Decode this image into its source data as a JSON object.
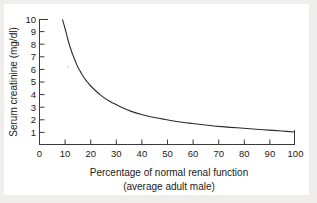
{
  "chart_data": {
    "type": "line",
    "title": "",
    "xlabel": "Percentage of normal renal function",
    "xlabel_line2": "(average adult male)",
    "ylabel": "Serum creatinine (mg/dl)",
    "xlim": [
      0,
      100
    ],
    "ylim": [
      0,
      10
    ],
    "grid": false,
    "legend": false,
    "xticks": [
      0,
      10,
      20,
      30,
      40,
      50,
      60,
      70,
      80,
      90,
      100
    ],
    "xtick_labels": [
      "0",
      "10",
      "20",
      "30",
      "40",
      "50",
      "60",
      "70",
      "80",
      "90",
      "100"
    ],
    "yticks": [
      1,
      2,
      3,
      4,
      5,
      6,
      7,
      8,
      9,
      10
    ],
    "ytick_labels": [
      "1",
      "2",
      "3",
      "4",
      "5",
      "6",
      "7",
      "8",
      "9",
      "10"
    ],
    "series": [
      {
        "name": "Serum creatinine",
        "color": "#2b2b2b",
        "x": [
          9,
          10,
          11,
          12,
          13,
          14,
          15,
          16,
          17,
          18,
          19,
          20,
          22,
          24,
          26,
          28,
          30,
          33,
          36,
          40,
          44,
          48,
          52,
          56,
          60,
          65,
          70,
          75,
          80,
          85,
          90,
          95,
          100
        ],
        "y": [
          10.0,
          9.3,
          8.5,
          7.8,
          7.2,
          6.7,
          6.2,
          5.85,
          5.5,
          5.2,
          4.95,
          4.7,
          4.3,
          3.95,
          3.65,
          3.4,
          3.2,
          2.9,
          2.65,
          2.4,
          2.2,
          2.05,
          1.9,
          1.78,
          1.68,
          1.56,
          1.45,
          1.37,
          1.3,
          1.22,
          1.15,
          1.08,
          1.0
        ]
      }
    ]
  },
  "axes": {
    "y_axis_title": "Serum creatinine (mg/dl)",
    "x_axis_title_line1": "Percentage of normal renal function",
    "x_axis_title_line2": "(average adult male)"
  }
}
